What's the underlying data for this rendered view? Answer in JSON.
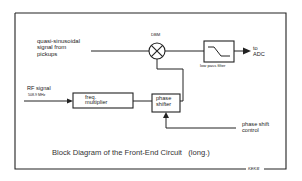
{
  "diagram": {
    "title": "Block Diagram of the Front-End Circuit",
    "title_suffix": "(long.)",
    "signature": "KEKB",
    "inputs": {
      "pickup_signal": [
        "quasi-sinusoidal",
        "signal from",
        "pickups"
      ],
      "rf_signal": "RF signal",
      "rf_frequency": "508.9 MHz",
      "phase_control": [
        "phase shift",
        "control"
      ]
    },
    "blocks": {
      "mixer": "DBM",
      "low_pass_filter": "low pass filter",
      "freq_multiplier": [
        "freq.",
        "multiplier"
      ],
      "phase_shifter": [
        "phase",
        "shifter"
      ]
    },
    "outputs": {
      "adc": [
        "to",
        "ADC"
      ]
    },
    "colors": {
      "line": "#222222",
      "background": "#ffffff"
    }
  }
}
